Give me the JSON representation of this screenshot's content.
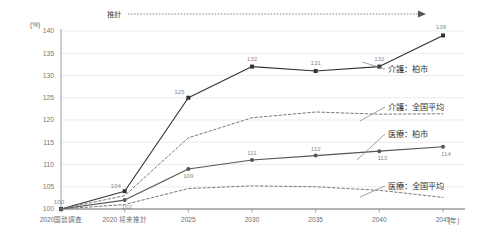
{
  "chart_data": {
    "type": "line",
    "title": "",
    "subtitle": "",
    "xlabel": "(年)",
    "ylabel": "(%)",
    "ylim": [
      100,
      140
    ],
    "yticks": [
      100,
      105,
      110,
      115,
      120,
      125,
      130,
      135,
      140
    ],
    "ytick_labels": [
      "100",
      "105",
      "110",
      "115",
      "120",
      "125",
      "130",
      "135",
      "140"
    ],
    "grid": true,
    "legend_position": "right-inline",
    "categories": [
      "2020国勢調査",
      "2020 将来推計",
      "2025",
      "2030",
      "2035",
      "2040",
      "2045"
    ],
    "annotations": [
      {
        "text": "推計",
        "kind": "arrow-range-label"
      }
    ],
    "series": [
      {
        "name": "介護：柏市",
        "style": "solid",
        "marker": "square",
        "color": "#333333",
        "values": [
          100,
          104,
          125,
          132,
          131,
          132,
          139
        ],
        "data_labels": [
          "100",
          "104",
          "125",
          "132",
          "131",
          "132",
          "139"
        ]
      },
      {
        "name": "医療：柏市",
        "style": "solid",
        "marker": "circle",
        "color": "#555555",
        "values": [
          100,
          102,
          109,
          111,
          112,
          113,
          114
        ],
        "data_labels": [
          "100",
          "102",
          "109",
          "111",
          "112",
          "113",
          "114"
        ]
      },
      {
        "name": "介護：全国平均",
        "style": "dashed",
        "marker": "none",
        "color": "#6b6b6b",
        "values": [
          100,
          103,
          116,
          120.5,
          121.8,
          121.3,
          121.4
        ],
        "data_labels": []
      },
      {
        "name": "医療：全国平均",
        "style": "dashed",
        "marker": "none",
        "color": "#6b6b6b",
        "values": [
          100,
          101,
          104.6,
          105.2,
          105.0,
          104.2,
          102.6
        ],
        "data_labels": []
      }
    ]
  }
}
